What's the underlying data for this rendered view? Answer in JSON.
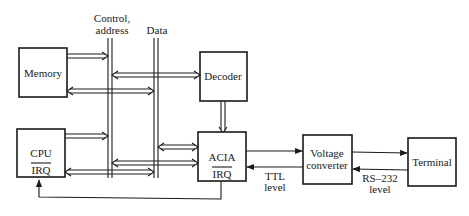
{
  "diagram": {
    "buses": {
      "control_address": {
        "label_line1": "Control,",
        "label_line2": "address"
      },
      "data": {
        "label": "Data"
      }
    },
    "blocks": {
      "memory": {
        "label": "Memory"
      },
      "decoder": {
        "label": "Decoder"
      },
      "cpu": {
        "label": "CPU",
        "sub_label": "IRQ"
      },
      "acia": {
        "label": "ACIA",
        "sub_label": "IRQ"
      },
      "voltage_converter": {
        "label_line1": "Voltage",
        "label_line2": "converter"
      },
      "terminal": {
        "label": "Terminal"
      }
    },
    "annotations": {
      "ttl": {
        "line1": "TTL",
        "line2": "level"
      },
      "rs232": {
        "line1": "RS–232",
        "line2": "level"
      }
    }
  }
}
